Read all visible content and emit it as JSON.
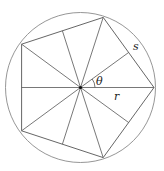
{
  "diagram": {
    "labels": {
      "theta": "θ",
      "r": "r",
      "s": "s"
    },
    "colors": {
      "stroke": "#555555",
      "circle": "#888888",
      "center_dot": "#111111"
    }
  }
}
